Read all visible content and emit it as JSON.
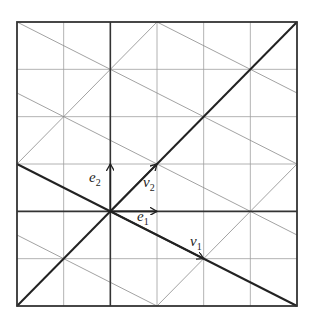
{
  "diagram": {
    "grid": {
      "x_range": [
        -2,
        4
      ],
      "y_range": [
        -2,
        4
      ],
      "step": 1
    },
    "colors": {
      "frame": "#333333",
      "grid": "#9a9a9a",
      "thin_diagonal": "#8a8a8a",
      "thick": "#222222",
      "axis": "#333333"
    },
    "vectors": [
      {
        "name": "e1",
        "label": "e",
        "sub": "1",
        "from": [
          0,
          0
        ],
        "to": [
          1,
          0
        ]
      },
      {
        "name": "e2",
        "label": "e",
        "sub": "2",
        "from": [
          0,
          0
        ],
        "to": [
          0,
          1
        ]
      },
      {
        "name": "v1",
        "label": "v",
        "sub": "1",
        "from": [
          0,
          0
        ],
        "to": [
          2,
          -1
        ]
      },
      {
        "name": "v2",
        "label": "v",
        "sub": "2",
        "from": [
          0,
          0
        ],
        "to": [
          1,
          1
        ]
      }
    ],
    "thick_lines": [
      {
        "name": "line-y-eq-x",
        "slope": 1,
        "intercept": 0
      },
      {
        "name": "line-y-eq-neg-half-x",
        "slope": -0.5,
        "intercept": 0
      }
    ],
    "thin_lines_slope_neg_half_intercepts": [
      4.5,
      3,
      1.5,
      -1.5
    ],
    "thin_lines_slope_one_intercepts": [
      3,
      -3
    ]
  },
  "labels": {
    "e1": {
      "main": "e",
      "sub": "1"
    },
    "e2": {
      "main": "e",
      "sub": "2"
    },
    "v1": {
      "main": "v",
      "sub": "1"
    },
    "v2": {
      "main": "v",
      "sub": "2"
    }
  }
}
